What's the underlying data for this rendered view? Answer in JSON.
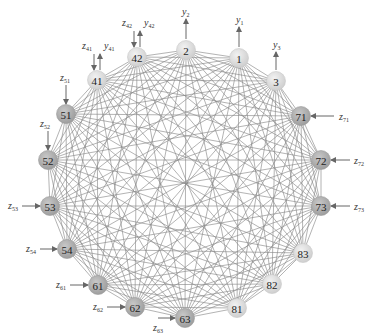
{
  "diagram": {
    "type": "complete-graph",
    "colors": {
      "edge": "#8a8a8a",
      "arrow": "#666666",
      "node_light": "#dcdcdc",
      "node_mid": "#c4c4c4",
      "node_dark": "#a9a9a9"
    },
    "nodes": [
      {
        "id": "1",
        "x": 239,
        "y": 58,
        "shade": "light"
      },
      {
        "id": "2",
        "x": 186,
        "y": 50,
        "shade": "light"
      },
      {
        "id": "3",
        "x": 276,
        "y": 81,
        "shade": "light"
      },
      {
        "id": "71",
        "x": 301,
        "y": 116,
        "shade": "dark"
      },
      {
        "id": "72",
        "x": 321,
        "y": 160,
        "shade": "dark"
      },
      {
        "id": "73",
        "x": 321,
        "y": 206,
        "shade": "dark"
      },
      {
        "id": "83",
        "x": 303,
        "y": 253,
        "shade": "light"
      },
      {
        "id": "82",
        "x": 272,
        "y": 284,
        "shade": "light"
      },
      {
        "id": "81",
        "x": 237,
        "y": 308,
        "shade": "light"
      },
      {
        "id": "63",
        "x": 185,
        "y": 318,
        "shade": "dark"
      },
      {
        "id": "62",
        "x": 135,
        "y": 307,
        "shade": "dark"
      },
      {
        "id": "61",
        "x": 98,
        "y": 285,
        "shade": "dark"
      },
      {
        "id": "54",
        "x": 67,
        "y": 249,
        "shade": "dark"
      },
      {
        "id": "53",
        "x": 50,
        "y": 206,
        "shade": "dark"
      },
      {
        "id": "52",
        "x": 48,
        "y": 160,
        "shade": "dark"
      },
      {
        "id": "51",
        "x": 66,
        "y": 114,
        "shade": "dark"
      },
      {
        "id": "41",
        "x": 97,
        "y": 80,
        "shade": "light"
      },
      {
        "id": "42",
        "x": 137,
        "y": 57,
        "shade": "light"
      }
    ],
    "io": [
      {
        "var": "y",
        "sub": "2",
        "dir": "out-up",
        "node": "2",
        "x1": 186,
        "y1": 39,
        "x2": 186,
        "y2": 19,
        "lx": 182,
        "ly": 15
      },
      {
        "var": "y",
        "sub": "1",
        "dir": "out-up",
        "node": "1",
        "x1": 239,
        "y1": 47,
        "x2": 239,
        "y2": 27,
        "lx": 236,
        "ly": 23
      },
      {
        "var": "y",
        "sub": "3",
        "dir": "out-up",
        "node": "3",
        "x1": 276,
        "y1": 70,
        "x2": 276,
        "y2": 52,
        "lx": 273,
        "ly": 48
      },
      {
        "var": "z",
        "sub": "42",
        "dir": "in-down",
        "node": "42",
        "x1": 134,
        "y1": 31,
        "x2": 134,
        "y2": 47,
        "lx": 122,
        "ly": 26
      },
      {
        "var": "y",
        "sub": "42",
        "dir": "out-up",
        "node": "42",
        "x1": 140,
        "y1": 47,
        "x2": 140,
        "y2": 31,
        "lx": 144,
        "ly": 26
      },
      {
        "var": "z",
        "sub": "41",
        "dir": "in-down",
        "node": "41",
        "x1": 94,
        "y1": 54,
        "x2": 94,
        "y2": 70,
        "lx": 82,
        "ly": 49
      },
      {
        "var": "y",
        "sub": "41",
        "dir": "out-up",
        "node": "41",
        "x1": 100,
        "y1": 70,
        "x2": 100,
        "y2": 54,
        "lx": 104,
        "ly": 49
      },
      {
        "var": "z",
        "sub": "51",
        "dir": "in-down",
        "node": "51",
        "x1": 66,
        "y1": 85,
        "x2": 66,
        "y2": 104,
        "lx": 60,
        "ly": 81
      },
      {
        "var": "z",
        "sub": "52",
        "dir": "in-down",
        "node": "52",
        "x1": 48,
        "y1": 131,
        "x2": 48,
        "y2": 150,
        "lx": 40,
        "ly": 127
      },
      {
        "var": "z",
        "sub": "53",
        "dir": "in-right",
        "node": "53",
        "x1": 22,
        "y1": 206,
        "x2": 40,
        "y2": 206,
        "lx": 8,
        "ly": 209
      },
      {
        "var": "z",
        "sub": "54",
        "dir": "in-right",
        "node": "54",
        "x1": 40,
        "y1": 249,
        "x2": 57,
        "y2": 249,
        "lx": 26,
        "ly": 252
      },
      {
        "var": "z",
        "sub": "61",
        "dir": "in-right",
        "node": "61",
        "x1": 70,
        "y1": 285,
        "x2": 88,
        "y2": 285,
        "lx": 56,
        "ly": 288
      },
      {
        "var": "z",
        "sub": "62",
        "dir": "in-right",
        "node": "62",
        "x1": 107,
        "y1": 307,
        "x2": 125,
        "y2": 307,
        "lx": 93,
        "ly": 310
      },
      {
        "var": "z",
        "sub": "63",
        "dir": "in-right",
        "node": "63",
        "x1": 158,
        "y1": 318,
        "x2": 175,
        "y2": 318,
        "lx": 153,
        "ly": 331
      },
      {
        "var": "z",
        "sub": "71",
        "dir": "in-left",
        "node": "71",
        "x1": 334,
        "y1": 116,
        "x2": 311,
        "y2": 116,
        "lx": 339,
        "ly": 120
      },
      {
        "var": "z",
        "sub": "72",
        "dir": "in-left",
        "node": "72",
        "x1": 350,
        "y1": 160,
        "x2": 331,
        "y2": 160,
        "lx": 354,
        "ly": 164
      },
      {
        "var": "z",
        "sub": "73",
        "dir": "in-left",
        "node": "73",
        "x1": 350,
        "y1": 206,
        "x2": 331,
        "y2": 206,
        "lx": 354,
        "ly": 210
      }
    ]
  }
}
